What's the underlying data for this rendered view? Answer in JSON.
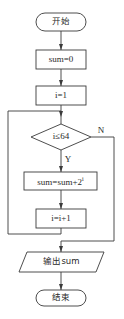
{
  "diagram": {
    "type": "flowchart",
    "nodes": {
      "start": {
        "shape": "terminal",
        "label": "开始"
      },
      "init_sum": {
        "shape": "process",
        "label": "sum=0"
      },
      "init_i": {
        "shape": "process",
        "label": "i=1"
      },
      "condition": {
        "shape": "decision",
        "label": "i≤64"
      },
      "accumulate": {
        "shape": "process",
        "label_base": "sum=sum+2",
        "label_sup": "i"
      },
      "increment": {
        "shape": "process",
        "label": "i=i+1"
      },
      "output": {
        "shape": "io",
        "label": "输出sum"
      },
      "end": {
        "shape": "terminal",
        "label": "结束"
      }
    },
    "edge_labels": {
      "yes": "Y",
      "no": "N"
    },
    "edges": [
      {
        "from": "start",
        "to": "init_sum"
      },
      {
        "from": "init_sum",
        "to": "init_i"
      },
      {
        "from": "init_i",
        "to": "condition"
      },
      {
        "from": "condition",
        "to": "accumulate",
        "label": "Y"
      },
      {
        "from": "accumulate",
        "to": "increment"
      },
      {
        "from": "increment",
        "to": "condition",
        "note": "loop back via left side"
      },
      {
        "from": "condition",
        "to": "output",
        "label": "N"
      },
      {
        "from": "output",
        "to": "end"
      }
    ]
  },
  "colors": {
    "stroke": "#3a3a3a",
    "text": "#2a2a2a",
    "background": "#ffffff"
  }
}
